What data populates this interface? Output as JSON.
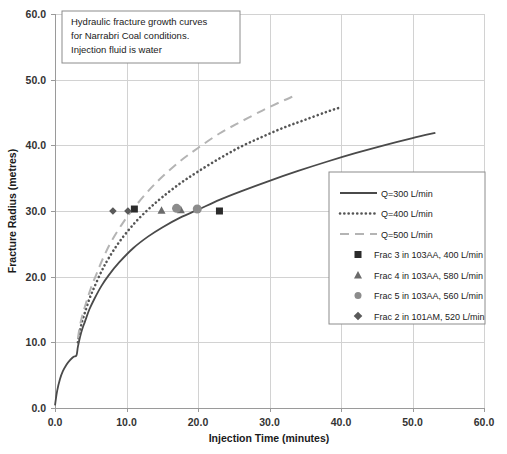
{
  "chart_data": {
    "type": "line",
    "title": "",
    "xlabel": "Injection Time (minutes)",
    "ylabel": "Fracture Radius (metres)",
    "xlim": [
      0.0,
      60.0
    ],
    "ylim": [
      0.0,
      60.0
    ],
    "xticks": [
      "0.0",
      "10.0",
      "20.0",
      "30.0",
      "40.0",
      "50.0",
      "60.0"
    ],
    "yticks": [
      "0.0",
      "10.0",
      "20.0",
      "30.0",
      "40.0",
      "50.0",
      "60.0"
    ],
    "grid": true,
    "legend_position": "center-right",
    "annotation": {
      "line1": "Hydraulic fracture growth curves",
      "line2": "for Narrabri Coal conditions.",
      "line3": "Injection fluid is  water"
    },
    "series": [
      {
        "name": "Q=300 L/min",
        "style": "solid",
        "color": "#4a4a4a",
        "x": [
          0.0,
          0.3,
          0.7,
          1.1,
          1.6,
          2.1,
          2.6,
          3.0,
          3.2,
          3.5,
          3.8,
          4.2,
          4.8,
          5.5,
          6.5,
          7.5,
          9.0,
          11.0,
          13.0,
          15.0,
          17.5,
          20.0,
          23.0,
          26.0,
          30.0,
          34.0,
          38.0,
          42.0,
          46.0,
          50.0,
          53.2
        ],
        "y": [
          0.4,
          2.6,
          4.4,
          5.6,
          6.6,
          7.3,
          7.8,
          8.0,
          9.3,
          10.8,
          12.0,
          13.2,
          15.0,
          16.6,
          18.6,
          20.2,
          22.2,
          24.4,
          26.1,
          27.5,
          29.0,
          30.2,
          31.7,
          33.0,
          34.6,
          36.1,
          37.5,
          38.8,
          40.0,
          41.1,
          41.9
        ]
      },
      {
        "name": "Q=400 L/min",
        "style": "dotted",
        "color": "#555555",
        "x": [
          3.2,
          3.5,
          3.8,
          4.2,
          4.8,
          5.5,
          6.5,
          7.5,
          9.0,
          11.0,
          13.0,
          15.0,
          17.5,
          20.0,
          23.0,
          26.0,
          29.0,
          32.0,
          35.0,
          38.0,
          40.0
        ],
        "y": [
          10.0,
          11.8,
          13.2,
          14.6,
          16.6,
          18.4,
          20.8,
          22.8,
          25.3,
          28.0,
          30.2,
          32.1,
          34.2,
          36.0,
          38.0,
          39.8,
          41.3,
          42.7,
          43.9,
          45.1,
          45.8
        ]
      },
      {
        "name": "Q=500 L/min",
        "style": "dashed",
        "color": "#b4b4b4",
        "x": [
          3.2,
          3.5,
          3.9,
          4.4,
          5.0,
          5.8,
          6.8,
          8.0,
          9.5,
          11.0,
          13.0,
          15.0,
          17.5,
          20.0,
          23.0,
          26.0,
          29.0,
          31.5,
          33.2
        ],
        "y": [
          10.6,
          12.6,
          14.4,
          16.2,
          18.2,
          20.4,
          23.0,
          25.6,
          28.2,
          30.4,
          33.0,
          35.2,
          37.6,
          39.6,
          41.8,
          43.6,
          45.3,
          46.6,
          47.4
        ]
      }
    ],
    "markers": [
      {
        "name": "Frac 3 in 103AA, 400 L/min",
        "shape": "square",
        "color": "#2b2b2b",
        "size": 7,
        "points": [
          [
            11.1,
            30.3
          ],
          [
            23.0,
            30.0
          ]
        ]
      },
      {
        "name": "Frac 4 in 103AA, 580 L/min",
        "shape": "triangle",
        "color": "#6b6b6b",
        "size": 7,
        "points": [
          [
            14.9,
            30.1
          ],
          [
            17.6,
            30.2
          ]
        ]
      },
      {
        "name": "Frac 5 in 103AA, 560 L/min",
        "shape": "circle",
        "color": "#8c8c8c",
        "size": 9,
        "points": [
          [
            17.0,
            30.4
          ],
          [
            19.9,
            30.3
          ]
        ]
      },
      {
        "name": "Frac 2 in 101AM, 520 L/min",
        "shape": "diamond",
        "color": "#5a5a5a",
        "size": 6,
        "points": [
          [
            8.1,
            30.0
          ],
          [
            10.2,
            30.0
          ]
        ]
      }
    ],
    "legend_entries": [
      {
        "label": "Q=300 L/min",
        "kind": "line",
        "style": "solid",
        "color": "#4a4a4a"
      },
      {
        "label": "Q=400 L/min",
        "kind": "line",
        "style": "dotted",
        "color": "#555555"
      },
      {
        "label": "Q=500 L/min",
        "kind": "line",
        "style": "dashed",
        "color": "#b4b4b4"
      },
      {
        "label": "Frac 3 in 103AA, 400 L/min",
        "kind": "marker",
        "shape": "square",
        "color": "#2b2b2b"
      },
      {
        "label": "Frac 4 in 103AA, 580 L/min",
        "kind": "marker",
        "shape": "triangle",
        "color": "#6b6b6b"
      },
      {
        "label": "Frac 5 in 103AA, 560 L/min",
        "kind": "marker",
        "shape": "circle",
        "color": "#8c8c8c"
      },
      {
        "label": "Frac 2 in 101AM, 520 L/min",
        "kind": "marker",
        "shape": "diamond",
        "color": "#5a5a5a"
      }
    ]
  }
}
